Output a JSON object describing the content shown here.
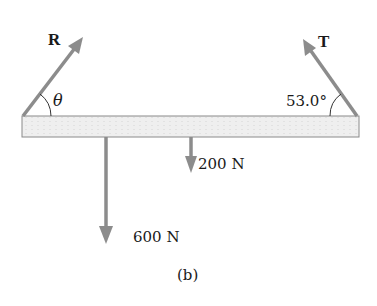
{
  "diagram": {
    "caption": "(b)",
    "beam": {
      "fill": "#ececec",
      "stroke": "#8a8a8a"
    },
    "arrow_color": "#8c8c8c",
    "forces": [
      {
        "id": "R",
        "label": "R",
        "angle_label": "θ",
        "direction": "up-right"
      },
      {
        "id": "T",
        "label": "T",
        "angle_label": "53.0°",
        "direction": "up-left"
      },
      {
        "id": "w1",
        "label": "600 N",
        "direction": "down"
      },
      {
        "id": "w2",
        "label": "200 N",
        "direction": "down"
      }
    ]
  }
}
